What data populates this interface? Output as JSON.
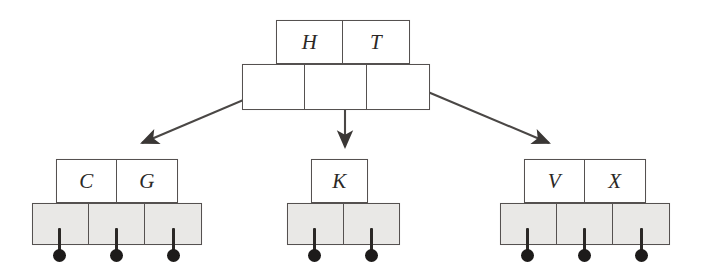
{
  "figure": {
    "style": {
      "background": "#ffffff",
      "line_color": "#555150",
      "text_color": "#2b2826",
      "pointer_fill_shaded": "#e9e8e6",
      "pointer_fill_root": "#ffffff",
      "null_dot_color": "#1d1b1a"
    }
  },
  "tree": {
    "root": {
      "name": "root-node",
      "keys": [
        "H",
        "T"
      ],
      "key_count": 2,
      "pointer_count": 3,
      "pointer_row_shaded": false,
      "children_labels": [
        "left",
        "middle",
        "right"
      ]
    },
    "children": [
      {
        "name": "left-child-node",
        "keys": [
          "C",
          "G"
        ],
        "key_count": 2,
        "pointer_count": 3,
        "pointer_row_shaded": true,
        "null_pointers": 3
      },
      {
        "name": "middle-child-node",
        "keys": [
          "K"
        ],
        "key_count": 1,
        "pointer_count": 2,
        "pointer_row_shaded": true,
        "null_pointers": 2
      },
      {
        "name": "right-child-node",
        "keys": [
          "V",
          "X"
        ],
        "key_count": 2,
        "pointer_count": 3,
        "pointer_row_shaded": true,
        "null_pointers": 3
      }
    ],
    "edges": [
      {
        "name": "edge-root-to-left",
        "from": "root-pointer-0",
        "to": "left-child-node",
        "direction": "down-left"
      },
      {
        "name": "edge-root-to-middle",
        "from": "root-pointer-1",
        "to": "middle-child-node",
        "direction": "down"
      },
      {
        "name": "edge-root-to-right",
        "from": "root-pointer-2",
        "to": "right-child-node",
        "direction": "down-right"
      }
    ]
  }
}
